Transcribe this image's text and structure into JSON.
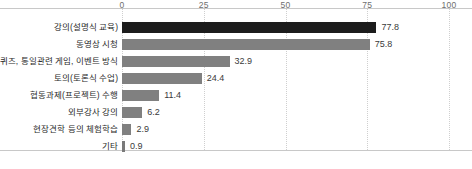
{
  "chart_data": {
    "type": "bar",
    "orientation": "horizontal",
    "title": "",
    "xlabel": "",
    "ylabel": "",
    "xlim": [
      0,
      100
    ],
    "xticks": [
      "0",
      "25",
      "50",
      "75",
      "100"
    ],
    "grid": "vertical-dotted",
    "legend": "none",
    "categories": [
      "강의(설명식 교육)",
      "동영상 시청",
      "퀴즈, 통일관련 게임, 이벤트 방식",
      "토의(토론식 수업)",
      "협동과제(프로젝트) 수행",
      "외부강사 강의",
      "현장견학 등의 체험학습",
      "기타"
    ],
    "values": [
      77.8,
      75.8,
      32.9,
      24.4,
      11.4,
      6.2,
      2.9,
      0.9
    ],
    "value_labels": [
      "77.8",
      "75.8",
      "32.9",
      "24.4",
      "11.4",
      "6.2",
      "2.9",
      "0.9"
    ],
    "colors": [
      "#1c1c1c",
      "#808080",
      "#808080",
      "#808080",
      "#808080",
      "#808080",
      "#808080",
      "#7a7a7a"
    ],
    "accent": "#1c1c1c",
    "bar_color": "#808080",
    "gridline_color": "#cfcfcf",
    "frame_color": "#c8c8c8",
    "background": "#ffffff"
  }
}
